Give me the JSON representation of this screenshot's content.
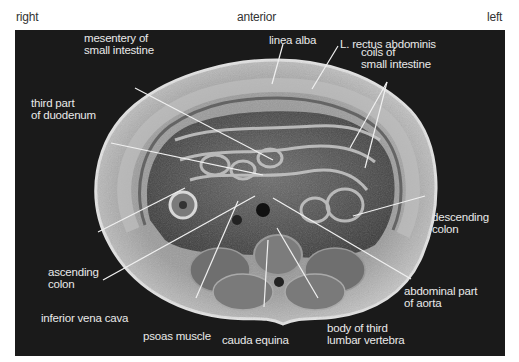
{
  "orientation": {
    "right": "right",
    "anterior": "anterior",
    "left": "left"
  },
  "figure": {
    "labels": {
      "linea_alba": "linea alba",
      "rectus": "L. rectus abdominis",
      "mesentery": "mesentery of\nsmall intestine",
      "coils": "coils of\nsmall intestine",
      "duodenum": "third part\nof duodenum",
      "descending_colon": "descending\ncolon",
      "ascending_colon": "ascending\ncolon",
      "ivc": "inferior vena cava",
      "psoas": "psoas muscle",
      "cauda": "cauda equina",
      "vertebra": "body of third\nlumbar vertebra",
      "aorta": "abdominal part\nof aorta"
    },
    "colors": {
      "background": "#1a1a1a",
      "label_text": "#e9e9e9",
      "leader_line": "#f0f0f0",
      "page": "#ffffff"
    }
  }
}
